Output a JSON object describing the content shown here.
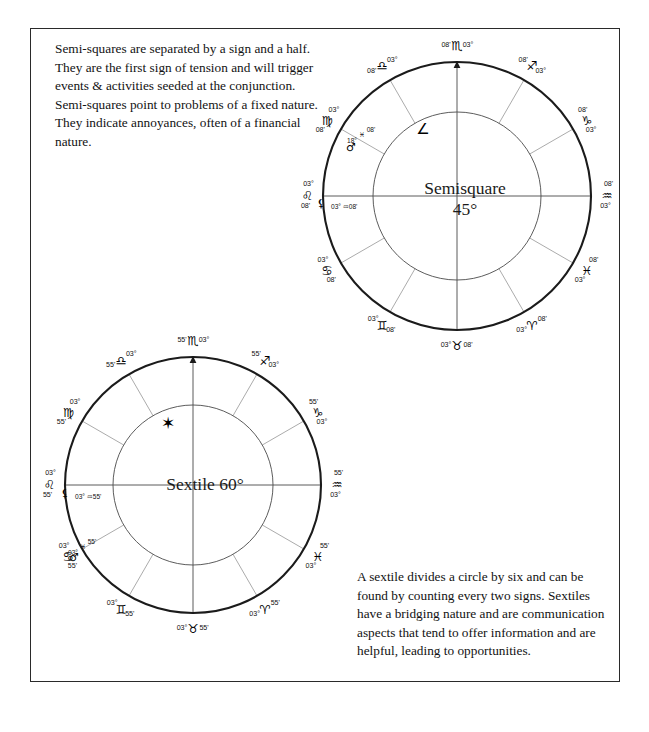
{
  "page": {
    "background_color": "#ffffff",
    "border_color": "#2a2a2a",
    "ink_color": "#1a1a1a"
  },
  "paragraphs": {
    "semisquare": "Semi-squares are separated by a sign and a half. They are the first sign of tension and will trigger events & activities seeded at the conjunction. Semi-squares point to problems of a fixed nature. They indicate annoyances, often of a financial nature.",
    "sextile": "A sextile divides a circle by six and can be found by counting every two signs. Sextiles have a bridging nature and are communication aspects that tend to offer information and are helpful, leading to opportunities."
  },
  "charts": [
    {
      "id": "semisquare-wheel",
      "center_label": "Semisquare\n45°",
      "aspect_name": "Semisquare",
      "aspect_degrees": "45°",
      "aspect_glyph": "∠",
      "minutes": "08'",
      "degree": "03°",
      "cusps": [
        {
          "position": "top",
          "degree": "03°",
          "sign_glyph": "♏",
          "sign_name": "Scorpio",
          "minutes": "08'"
        },
        {
          "position": "upper-right",
          "degree": "03°",
          "sign_glyph": "♎",
          "sign_name": "Libra",
          "minutes": "08'"
        },
        {
          "position": "right-upper",
          "degree": "03°",
          "sign_glyph": "♍",
          "sign_name": "Virgo",
          "minutes": "08'"
        },
        {
          "position": "right",
          "degree": "03°",
          "sign_glyph": "♌",
          "sign_name": "Leo",
          "minutes": "08'"
        },
        {
          "position": "right-lower",
          "degree": "03°",
          "sign_glyph": "♋",
          "sign_name": "Cancer",
          "minutes": "08'"
        },
        {
          "position": "lower-right",
          "degree": "03°",
          "sign_glyph": "♊",
          "sign_name": "Gemini",
          "minutes": "08'"
        },
        {
          "position": "bottom",
          "degree": "03°",
          "sign_glyph": "♉",
          "sign_name": "Taurus",
          "minutes": "08'"
        },
        {
          "position": "lower-left",
          "degree": "03°",
          "sign_glyph": "♈",
          "sign_name": "Aries",
          "minutes": "08'"
        },
        {
          "position": "left-lower",
          "degree": "03°",
          "sign_glyph": "♓",
          "sign_name": "Pisces",
          "minutes": "08'"
        },
        {
          "position": "left",
          "degree": "03°",
          "sign_glyph": "♒",
          "sign_name": "Aquarius",
          "minutes": "08'"
        },
        {
          "position": "left-upper",
          "degree": "03°",
          "sign_glyph": "♑",
          "sign_name": "Capricorn",
          "minutes": "08'"
        },
        {
          "position": "upper-left",
          "degree": "03°",
          "sign_glyph": "♐",
          "sign_name": "Sagittarius",
          "minutes": "08'"
        }
      ],
      "planets": [
        {
          "glyph": "♂",
          "name": "Mars",
          "degree": "18°",
          "sign_glyph": "♓",
          "sign_name": "Pisces",
          "minutes": "08'"
        },
        {
          "glyph": "⚸",
          "name": "Marker",
          "degree": "03°",
          "sign_glyph": "♒",
          "sign_name": "Aquarius",
          "minutes": "08'"
        }
      ]
    },
    {
      "id": "sextile-wheel",
      "center_label": "Sextile 60°",
      "aspect_name": "Sextile",
      "aspect_degrees": "60°",
      "aspect_glyph": "✶",
      "minutes": "55'",
      "degree": "03°",
      "cusps": [
        {
          "position": "top",
          "degree": "03°",
          "sign_glyph": "♏",
          "sign_name": "Scorpio",
          "minutes": "55'"
        },
        {
          "position": "upper-right",
          "degree": "03°",
          "sign_glyph": "♎",
          "sign_name": "Libra",
          "minutes": "55'"
        },
        {
          "position": "right-upper",
          "degree": "03°",
          "sign_glyph": "♍",
          "sign_name": "Virgo",
          "minutes": "55'"
        },
        {
          "position": "right",
          "degree": "03°",
          "sign_glyph": "♌",
          "sign_name": "Leo",
          "minutes": "55'"
        },
        {
          "position": "right-lower",
          "degree": "03°",
          "sign_glyph": "♋",
          "sign_name": "Cancer",
          "minutes": "55'"
        },
        {
          "position": "lower-right",
          "degree": "03°",
          "sign_glyph": "♊",
          "sign_name": "Gemini",
          "minutes": "55'"
        },
        {
          "position": "bottom",
          "degree": "03°",
          "sign_glyph": "♉",
          "sign_name": "Taurus",
          "minutes": "55'"
        },
        {
          "position": "lower-left",
          "degree": "03°",
          "sign_glyph": "♈",
          "sign_name": "Aries",
          "minutes": "55'"
        },
        {
          "position": "left-lower",
          "degree": "03°",
          "sign_glyph": "♓",
          "sign_name": "Pisces",
          "minutes": "55'"
        },
        {
          "position": "left",
          "degree": "03°",
          "sign_glyph": "♒",
          "sign_name": "Aquarius",
          "minutes": "55'"
        },
        {
          "position": "left-upper",
          "degree": "03°",
          "sign_glyph": "♑",
          "sign_name": "Capricorn",
          "minutes": "55'"
        },
        {
          "position": "upper-left",
          "degree": "03°",
          "sign_glyph": "♐",
          "sign_name": "Sagittarius",
          "minutes": "55'"
        }
      ],
      "planets": [
        {
          "glyph": "♂",
          "name": "Mars",
          "degree": "03°",
          "sign_glyph": "♓",
          "sign_name": "Pisces",
          "minutes": "55'"
        },
        {
          "glyph": "⚸",
          "name": "Marker",
          "degree": "03°",
          "sign_glyph": "♒",
          "sign_name": "Aquarius",
          "minutes": "55'"
        }
      ]
    }
  ]
}
